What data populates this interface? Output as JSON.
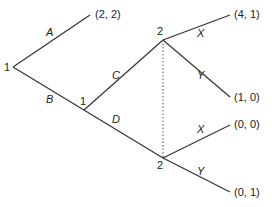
{
  "nodes": {
    "root": {
      "player": "1",
      "x": 13,
      "y": 67
    },
    "n1": {
      "player": "1",
      "x": 84,
      "y": 110
    },
    "n2a": {
      "player": "2",
      "x": 163,
      "y": 40
    },
    "n2b": {
      "player": "2",
      "x": 163,
      "y": 158
    }
  },
  "edges": {
    "A": "A",
    "B": "B",
    "C": "C",
    "D": "D",
    "X1": "X",
    "Y1": "Y",
    "X2": "X",
    "Y2": "Y"
  },
  "payoffs": {
    "A": "(2, 2)",
    "CX": "(4, 1)",
    "CY": "(1, 0)",
    "DX": "(0, 0)",
    "DY": "(0, 1)"
  }
}
